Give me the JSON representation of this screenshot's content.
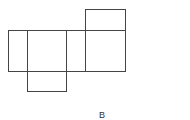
{
  "diagram": {
    "type": "box-net",
    "stroke_color": "#444444",
    "faces": [
      {
        "name": "left-side-face",
        "x": 8,
        "y": 30,
        "w": 19,
        "h": 41
      },
      {
        "name": "front-face",
        "x": 27,
        "y": 30,
        "w": 39,
        "h": 41
      },
      {
        "name": "bottom-face",
        "x": 27,
        "y": 71,
        "w": 39,
        "h": 20
      },
      {
        "name": "right-side-face",
        "x": 66,
        "y": 30,
        "w": 19,
        "h": 41
      },
      {
        "name": "back-face",
        "x": 85,
        "y": 30,
        "w": 40,
        "h": 41
      },
      {
        "name": "top-face",
        "x": 85,
        "y": 9,
        "w": 40,
        "h": 21
      }
    ],
    "labels": {
      "b": "B",
      "cut": "-"
    }
  }
}
